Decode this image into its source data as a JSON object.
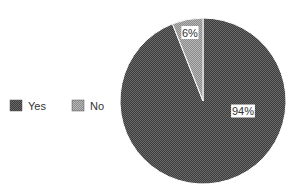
{
  "chart_data": {
    "type": "pie",
    "title": "",
    "slices": [
      {
        "label": "Yes",
        "value": 94,
        "data_label": "94%",
        "color": "#4a4a4a"
      },
      {
        "label": "No",
        "value": 6,
        "data_label": "6%",
        "color": "#9a9a9a"
      }
    ],
    "legend": {
      "position": "left",
      "entries": [
        "Yes",
        "No"
      ]
    }
  }
}
